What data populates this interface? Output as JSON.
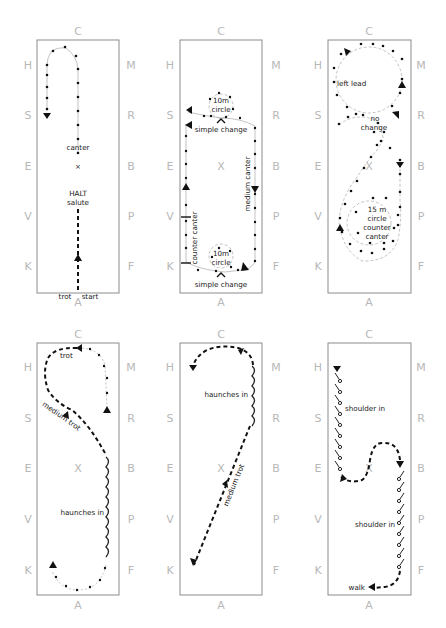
{
  "arena_letters": {
    "top": "C",
    "bottom": "A",
    "left": [
      "H",
      "S",
      "E",
      "V",
      "K"
    ],
    "right": [
      "M",
      "R",
      "B",
      "P",
      "F"
    ],
    "center": "X"
  },
  "panels": [
    {
      "id": 1,
      "labels": {
        "canter": "canter",
        "halt": "HALT",
        "salute": "salute",
        "trot": "trot",
        "start": "start"
      }
    },
    {
      "id": 2,
      "labels": {
        "circle_top_1": "10m",
        "circle_top_2": "circle",
        "simple_change_top": "simple change",
        "medium_canter": "medium canter",
        "counter_canter": "counter canter",
        "circle_bottom_1": "10m",
        "circle_bottom_2": "circle",
        "simple_change_bottom": "simple change"
      }
    },
    {
      "id": 3,
      "labels": {
        "left_lead": "left lead",
        "no": "no",
        "change": "change",
        "circle_1": "15 m",
        "circle_2": "circle",
        "circle_3": "counter",
        "circle_4": "canter"
      }
    },
    {
      "id": 4,
      "labels": {
        "trot": "trot",
        "medium_trot": "medium trot",
        "haunches_in": "haunches  in"
      }
    },
    {
      "id": 5,
      "labels": {
        "haunches_in": "haunches in",
        "medium_trot": "medium trot"
      }
    },
    {
      "id": 6,
      "labels": {
        "shoulder_in_top": "shoulder in",
        "shoulder_in_bottom": "shoulder in",
        "walk": "walk"
      }
    }
  ]
}
